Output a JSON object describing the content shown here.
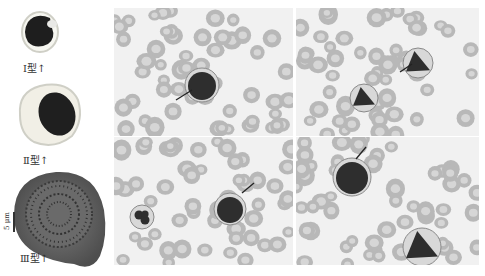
{
  "figure": {
    "legend": {
      "types": [
        {
          "label": "Ⅰ型↑"
        },
        {
          "label": "Ⅱ型↑"
        },
        {
          "label": "Ⅲ型↑"
        }
      ],
      "scale_bar": "5 μm"
    },
    "panels": [
      {
        "name": "top-left-smear"
      },
      {
        "name": "top-right-smear"
      },
      {
        "name": "bottom-left-smear"
      },
      {
        "name": "bottom-right-smear"
      }
    ],
    "colors": {
      "rbc": "#b8b8b8",
      "rbc_center": "#d6d6d6",
      "nucleus": "#2e2e2e",
      "background": "#f1f1f1"
    }
  }
}
